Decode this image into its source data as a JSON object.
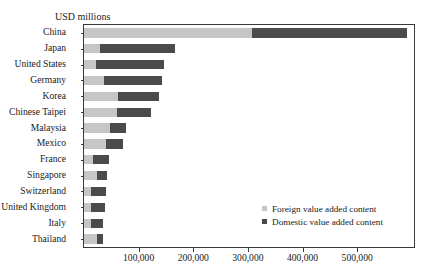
{
  "top_cutoff_text": "",
  "axis_unit_label": "USD millions",
  "legend": {
    "items": [
      {
        "label": "Foreign value added content",
        "color": "#c6c6c6",
        "key": "foreign"
      },
      {
        "label": "Domestic value added content",
        "color": "#4b4b4b",
        "key": "domestic"
      }
    ]
  },
  "colors": {
    "foreign": "#c6c6c6",
    "domestic": "#4b4b4b",
    "axis": "#3a3a3a",
    "text": "#1a1a1a",
    "background": "#ffffff"
  },
  "chart_data": {
    "type": "bar",
    "orientation": "horizontal",
    "stacked": true,
    "title": "",
    "subtitle": "",
    "xlabel": "USD millions",
    "ylabel": "",
    "xlim": [
      0,
      604000
    ],
    "xticks": [
      100000,
      200000,
      300000,
      400000,
      500000
    ],
    "xtick_labels": [
      "100,000",
      "200,000",
      "300,000",
      "400,000",
      "500,000"
    ],
    "grid": false,
    "legend_position": "inside-lower-right",
    "categories": [
      "China",
      "Japan",
      "United States",
      "Germany",
      "Korea",
      "Chinese Taipei",
      "Malaysia",
      "Mexico",
      "France",
      "Singapore",
      "Switzerland",
      "United Kingdom",
      "Italy",
      "Thailand"
    ],
    "series": [
      {
        "name": "Foreign value added content",
        "color": "#c6c6c6",
        "values": [
          307000,
          29000,
          22000,
          36000,
          62000,
          60000,
          47000,
          40000,
          16000,
          24000,
          13000,
          13000,
          12000,
          23000
        ]
      },
      {
        "name": "Domestic value added content",
        "color": "#4b4b4b",
        "values": [
          284000,
          138000,
          124000,
          106000,
          76000,
          63000,
          29000,
          31000,
          29000,
          18000,
          27000,
          25000,
          22000,
          11000
        ]
      }
    ],
    "totals": [
      591000,
      167000,
      146000,
      142000,
      138000,
      123000,
      76000,
      71000,
      45000,
      42000,
      40000,
      38000,
      34000,
      34000
    ]
  }
}
